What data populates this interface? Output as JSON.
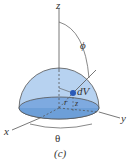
{
  "figure": {
    "caption": "(c)",
    "axes": {
      "z": "z",
      "x": "x",
      "y": "y"
    },
    "labels": {
      "phi": "ϕ",
      "theta": "θ",
      "r": "r",
      "z": "z",
      "dV": "dV"
    },
    "colors": {
      "hemisphere": "#a9c8ec",
      "base": "#6d9fd8",
      "element": "#2a5ab8",
      "stroke": "#4a4a4a"
    }
  }
}
